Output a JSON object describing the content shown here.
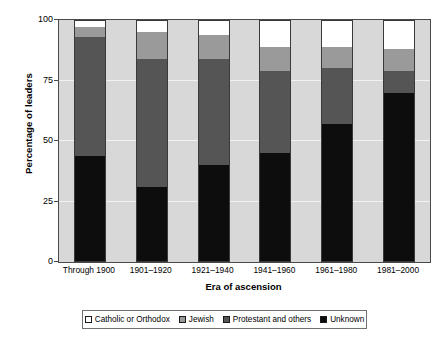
{
  "chart_data": {
    "type": "bar",
    "title": "",
    "subtitle": "",
    "xlabel": "Era of ascension",
    "ylabel": "Percentage of leaders",
    "ylim": [
      0,
      100
    ],
    "yticks": [
      0,
      25,
      50,
      75,
      100
    ],
    "ytick_labels": [
      "0",
      "25",
      "50",
      "75",
      "100"
    ],
    "grid": true,
    "stacked": true,
    "stack_total": 100,
    "legend_position": "bottom",
    "categories": [
      "Through 1900",
      "1901–1920",
      "1921–1940",
      "1941–1960",
      "1961–1980",
      "1981–2000"
    ],
    "series": [
      {
        "name": "Unknown",
        "color": "#0d0d0d",
        "values": [
          44,
          31,
          40,
          45,
          57,
          70
        ]
      },
      {
        "name": "Protestant and others",
        "color": "#555555",
        "values": [
          49,
          53,
          44,
          34,
          23,
          9
        ]
      },
      {
        "name": "Jewish",
        "color": "#9a9a9a",
        "values": [
          4,
          11,
          10,
          10,
          9,
          9
        ]
      },
      {
        "name": "Catholic or Orthodox",
        "color": "#ffffff",
        "values": [
          3,
          5,
          6,
          11,
          11,
          12
        ]
      }
    ],
    "plot_background": "#d8d8d8",
    "gridline_color": "#f2f2f2",
    "axis_color": "#4a4a4a"
  },
  "legend": {
    "items": [
      {
        "label": "Catholic or Orthodox",
        "color": "#ffffff"
      },
      {
        "label": "Jewish",
        "color": "#9a9a9a"
      },
      {
        "label": "Protestant and others",
        "color": "#555555"
      },
      {
        "label": "Unknown",
        "color": "#0d0d0d"
      }
    ]
  }
}
